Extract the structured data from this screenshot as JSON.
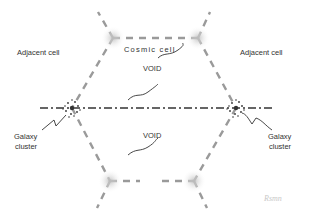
{
  "labels": {
    "adjacent_left": "Adjacent cell",
    "adjacent_right": "Adjacent cell",
    "cosmic_cell": "Cosmic cell",
    "void_top": "VOID",
    "void_bottom": "VOID",
    "cluster_left": [
      "Galaxy",
      "cluster"
    ],
    "cluster_right": [
      "Galaxy",
      "cluster"
    ],
    "watermark": "Rsmn"
  },
  "colors": {
    "filament": "#9a9a9a",
    "axis_line": "#333333",
    "node_glow": "#bdbdbd",
    "text": "#333333",
    "watermark": "#c8c8c8"
  }
}
